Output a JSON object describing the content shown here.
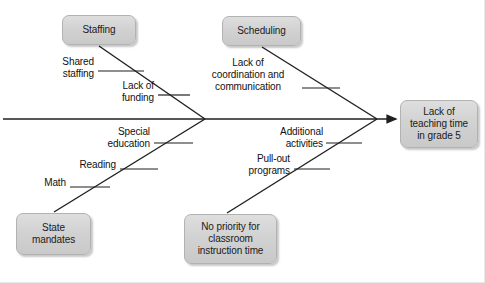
{
  "diagram": {
    "type": "fishbone-cause-and-effect",
    "effect": {
      "label": "Lack of\nteaching time\nin grade 5"
    },
    "categories": [
      {
        "id": "staffing",
        "label": "Staffing",
        "position": "top-left"
      },
      {
        "id": "scheduling",
        "label": "Scheduling",
        "position": "top-right"
      },
      {
        "id": "state-mandates",
        "label": "State\nmandates",
        "position": "bottom-left"
      },
      {
        "id": "no-priority",
        "label": "No priority for\nclassroom\ninstruction time",
        "position": "bottom-right"
      }
    ],
    "causes": [
      {
        "id": "shared-staffing",
        "label": "Shared\nstaffing",
        "category": "staffing"
      },
      {
        "id": "lack-funding",
        "label": "Lack of\nfunding",
        "category": "staffing"
      },
      {
        "id": "coordination",
        "label": "Lack of\ncoordination and\ncommunication",
        "category": "scheduling"
      },
      {
        "id": "special-ed",
        "label": "Special\neducation",
        "category": "state-mandates"
      },
      {
        "id": "reading",
        "label": "Reading",
        "category": "state-mandates"
      },
      {
        "id": "math",
        "label": "Math",
        "category": "state-mandates"
      },
      {
        "id": "additional",
        "label": "Additional\nactivities",
        "category": "no-priority"
      },
      {
        "id": "pullout",
        "label": "Pull-out\nprograms",
        "category": "no-priority"
      }
    ],
    "colors": {
      "box_fill": "#d2d2d2",
      "box_border": "#b2b2b2",
      "line": "#1f1f1f",
      "text": "#111111",
      "background": "#ffffff"
    }
  }
}
